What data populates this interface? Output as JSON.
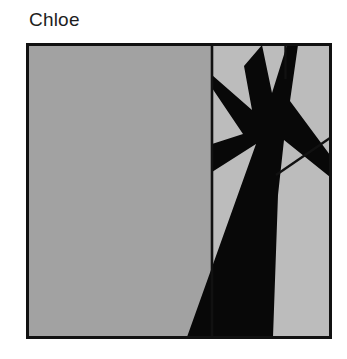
{
  "page": {
    "background_color": "#ffffff",
    "width": 347,
    "height": 359
  },
  "title": {
    "text": "Chloe",
    "color": "#1e1e1e"
  },
  "artwork": {
    "caption": "Chloe",
    "description": "Abstract geometric composition: large flat gray field on the left, and on the right a panel containing a black star-burst splat over light gray facets, with a tapering black wedge descending to the bottom edge.",
    "frame": {
      "border_color": "#111111",
      "border_width_px": 3,
      "x": 26,
      "y": 43,
      "width": 306,
      "height": 296
    },
    "palette": {
      "left_field_gray": "#a2a2a2",
      "right_field_gray": "#bcbcbc",
      "ink_black": "#080808",
      "divider": "#111111",
      "paper_white": "#ffffff"
    },
    "regions": [
      {
        "name": "left-gray-field",
        "fill": "#a2a2a2",
        "shape": "rectangle",
        "points": "0,0 186,0 186,296 0,296"
      },
      {
        "name": "right-light-field",
        "fill": "#bcbcbc",
        "shape": "rectangle",
        "points": "186,0 306,0 306,296 186,296"
      },
      {
        "name": "black-starburst",
        "fill": "#080808",
        "shape": "polygon",
        "points": "236,0 247,52 262,0 272,0 264,58 306,113 306,134 258,96 254,150 246,296 160,296 229,100 186,128 186,100 216,90 186,44 186,31 225,66 217,22"
      },
      {
        "name": "upper-divider-vertical",
        "fill": "#111111",
        "shape": "line",
        "points": "259,0 259,36"
      },
      {
        "name": "right-diagonal",
        "fill": "#111111",
        "shape": "line",
        "points": "306,96 252,131"
      },
      {
        "name": "center-divider-vertical",
        "fill": "#111111",
        "shape": "line",
        "points": "186,0 186,296"
      }
    ]
  }
}
